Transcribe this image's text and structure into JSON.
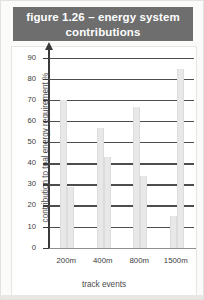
{
  "figure": {
    "title": "figure 1.26 – energy system contributions",
    "title_color": "#6e6e6e"
  },
  "chart_data": {
    "type": "bar",
    "title": "figure 1.26 – energy system contributions",
    "categories": [
      "200m",
      "400m",
      "800m",
      "1500m"
    ],
    "series": [
      {
        "name": "series-1",
        "values": [
          70,
          57,
          67,
          15
        ]
      },
      {
        "name": "series-2",
        "values": [
          29,
          43,
          34,
          85
        ]
      }
    ],
    "xlabel": "track events",
    "ylabel": "contribution to toal energy requirement %",
    "ylim": [
      0,
      90
    ],
    "yticks": [
      0,
      10,
      20,
      30,
      40,
      50,
      60,
      70,
      80,
      90
    ],
    "ytick_labels": [
      "0",
      "10",
      "20",
      "30",
      "40",
      "50",
      "60",
      "70",
      "80",
      "90"
    ],
    "grid": true,
    "legend": null,
    "bar_color": "#e8e8e8"
  }
}
